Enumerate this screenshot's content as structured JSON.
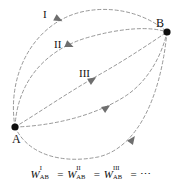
{
  "figure": {
    "background_color": "#ffffff",
    "line_color": "#8c8c8c",
    "marker_color": "#101010",
    "text_color": "#111111",
    "width": 183,
    "height": 191
  },
  "points": [
    {
      "id": "A",
      "label": "A",
      "x": 15,
      "y": 127,
      "label_x": 12,
      "label_y": 133
    },
    {
      "id": "B",
      "label": "B",
      "x": 167,
      "y": 32,
      "label_x": 156,
      "label_y": 17
    }
  ],
  "path_labels": [
    {
      "id": "I",
      "label": "I",
      "x": 43,
      "y": 9
    },
    {
      "id": "II",
      "label": "II",
      "x": 54,
      "y": 39
    },
    {
      "id": "III",
      "label": "III",
      "x": 79,
      "y": 68
    }
  ],
  "paths": [
    {
      "id": "outer-top",
      "label": "I",
      "d": "M 15 127 C 6 72 36 20 86 11 C 120 5 150 17 167 32",
      "arrow_x": 58,
      "arrow_y": 19,
      "arrow_angle": 28
    },
    {
      "id": "path-two",
      "label": "II",
      "d": "M 15 127 C 17 84 43 51 86 38 C 120 28 150 26 167 32",
      "arrow_x": 69,
      "arrow_y": 45,
      "arrow_angle": 23
    },
    {
      "id": "path-three",
      "label": "III",
      "d": "M 15 127 C 40 112 70 91 104 72 C 130 57 152 42 167 32",
      "arrow_x": 92,
      "arrow_y": 80,
      "arrow_angle": -32
    },
    {
      "id": "path-four",
      "label": "",
      "d": "M 15 127 C 50 126 92 117 124 97 C 148 82 162 55 167 32",
      "arrow_x": 106,
      "arrow_y": 108,
      "arrow_angle": -34
    },
    {
      "id": "path-five",
      "label": "",
      "d": "M 15 127 C 28 155 62 164 98 157 C 134 149 160 104 167 32",
      "arrow_x": 132,
      "arrow_y": 140,
      "arrow_angle": -55
    }
  ],
  "equation": {
    "terms": [
      {
        "base": "W",
        "sup": "I",
        "sub": "AB"
      },
      {
        "base": "W",
        "sup": "II",
        "sub": "AB"
      },
      {
        "base": "W",
        "sup": "III",
        "sub": "AB"
      }
    ],
    "operator": "=",
    "ellipsis": "⋯",
    "plain_text": "W_AB^I = W_AB^II = W_AB^III = ⋯"
  }
}
